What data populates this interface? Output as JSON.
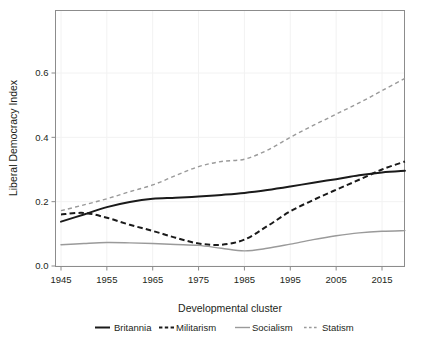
{
  "chart_data": {
    "type": "line",
    "title": "",
    "xlabel": "Developmental cluster",
    "ylabel": "Liberal Democracy Index",
    "xlim": [
      1944,
      1921
    ],
    "x_ticks": [
      1945,
      1955,
      1965,
      1975,
      1985,
      1995,
      2005,
      2015
    ],
    "x_tick_labels": [
      "1945",
      "1955",
      "1965",
      "1975",
      "1985",
      "1995",
      "2005",
      "2015"
    ],
    "y_ticks": [
      0.0,
      0.2,
      0.4,
      0.6
    ],
    "y_tick_labels": [
      "0.0",
      "0.2",
      "0.4",
      "0.6"
    ],
    "ylim": [
      -0.035,
      0.745
    ],
    "grid": "faint",
    "legend_position": "below",
    "x": [
      1945,
      1950,
      1955,
      1960,
      1965,
      1970,
      1975,
      1980,
      1985,
      1990,
      1995,
      2000,
      2005,
      2010,
      2015,
      2020
    ],
    "series": [
      {
        "name": "Britannia",
        "color": "#1a1a1a",
        "style": "solid",
        "width": 2.0,
        "values": [
          0.138,
          0.16,
          0.183,
          0.199,
          0.209,
          0.212,
          0.216,
          0.221,
          0.227,
          0.236,
          0.247,
          0.259,
          0.27,
          0.282,
          0.291,
          0.296
        ]
      },
      {
        "name": "Militarism",
        "color": "#1a1a1a",
        "style": "dashed",
        "width": 2.0,
        "values": [
          0.16,
          0.165,
          0.15,
          0.128,
          0.109,
          0.088,
          0.07,
          0.066,
          0.082,
          0.124,
          0.17,
          0.205,
          0.237,
          0.268,
          0.3,
          0.325
        ]
      },
      {
        "name": "Socialism",
        "color": "#9a9a9a",
        "style": "solid",
        "width": 1.4,
        "values": [
          0.066,
          0.07,
          0.073,
          0.072,
          0.07,
          0.067,
          0.064,
          0.055,
          0.047,
          0.055,
          0.068,
          0.082,
          0.094,
          0.103,
          0.108,
          0.11
        ]
      },
      {
        "name": "Statism",
        "color": "#9a9a9a",
        "style": "dotted",
        "width": 1.4,
        "values": [
          0.172,
          0.19,
          0.209,
          0.231,
          0.252,
          0.281,
          0.309,
          0.325,
          0.332,
          0.36,
          0.4,
          0.437,
          0.472,
          0.507,
          0.545,
          0.583
        ]
      }
    ]
  },
  "legend": {
    "items": [
      {
        "label": "Britannia",
        "swatch": "solid-black"
      },
      {
        "label": "Militarism",
        "swatch": "dashed-black"
      },
      {
        "label": "Socialism",
        "swatch": "solid-gray"
      },
      {
        "label": "Statism",
        "swatch": "dotted-gray"
      }
    ]
  },
  "colors": {
    "series_dark": "#1a1a1a",
    "series_gray": "#9a9a9a",
    "axis": "#8c8c8c",
    "grid": "#f2f2f2",
    "text": "#231f20",
    "background": "#ffffff"
  }
}
